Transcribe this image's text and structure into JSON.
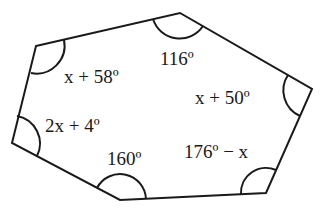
{
  "diagram": {
    "type": "hexagon-interior-angles",
    "colors": {
      "stroke": "#1a1a1a",
      "text": "#1a1a1a",
      "background": "#ffffff"
    },
    "vertices": [
      {
        "id": "top-left",
        "x": 36,
        "y": 46
      },
      {
        "id": "top",
        "x": 180,
        "y": 13
      },
      {
        "id": "right",
        "x": 312,
        "y": 89
      },
      {
        "id": "bottom-right",
        "x": 266,
        "y": 193
      },
      {
        "id": "bottom",
        "x": 120,
        "y": 200
      },
      {
        "id": "left",
        "x": 12,
        "y": 143
      }
    ],
    "angles": [
      {
        "vertex": "top-left",
        "label": "x + 58º"
      },
      {
        "vertex": "top",
        "label": "116º"
      },
      {
        "vertex": "right",
        "label": "x + 50º"
      },
      {
        "vertex": "bottom-right",
        "label": "176º − x"
      },
      {
        "vertex": "bottom",
        "label": "160º"
      },
      {
        "vertex": "left",
        "label": "2x + 4º"
      }
    ]
  }
}
